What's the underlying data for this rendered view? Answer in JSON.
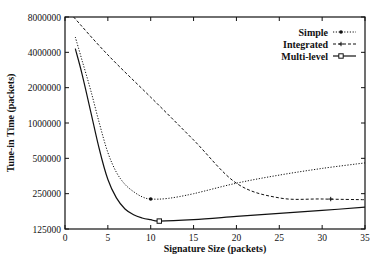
{
  "chart_data": {
    "type": "line",
    "title": "",
    "xlabel": "Signature Size (packets)",
    "ylabel": "Tune-in Time (packets)",
    "xlim": [
      0,
      35
    ],
    "ylim": [
      125000,
      8000000
    ],
    "yscale": "log2",
    "xticks": [
      0,
      5,
      10,
      15,
      20,
      25,
      30,
      35
    ],
    "yticks": [
      125000,
      250000,
      500000,
      1000000,
      2000000,
      4000000,
      8000000
    ],
    "ytick_labels": [
      "125000",
      "250000",
      "500000",
      "1000000",
      "2000000",
      "4000000",
      "8000000"
    ],
    "grid": false,
    "legend_position": "top-right",
    "series": [
      {
        "name": "Simple",
        "style": "dotted",
        "marker": "dot",
        "marker_at": [
          10,
          225000
        ],
        "x": [
          1.2,
          2,
          3,
          4,
          5,
          6,
          7,
          8,
          9,
          10,
          12,
          15,
          20,
          25,
          30,
          35
        ],
        "values": [
          5400000,
          3400000,
          1900000,
          1000000,
          560000,
          380000,
          300000,
          260000,
          235000,
          225000,
          228000,
          250000,
          307000,
          360000,
          410000,
          457000
        ]
      },
      {
        "name": "Integrated",
        "style": "dashed",
        "marker": "plus",
        "marker_at": [
          31,
          225000
        ],
        "x": [
          1,
          5,
          10,
          15,
          20,
          25,
          30,
          35
        ],
        "values": [
          8000000,
          3800000,
          1660000,
          716000,
          307000,
          230000,
          225000,
          222000
        ]
      },
      {
        "name": "Multi-level",
        "style": "solid",
        "marker": "square",
        "marker_at": [
          11,
          146000
        ],
        "x": [
          1.2,
          2,
          3,
          4,
          5,
          6,
          7,
          8,
          9,
          10,
          11,
          15,
          20,
          25,
          30,
          35
        ],
        "values": [
          4300000,
          2600000,
          1250000,
          600000,
          330000,
          230000,
          185000,
          165000,
          155000,
          150000,
          146000,
          150000,
          160000,
          170000,
          180000,
          192000
        ]
      }
    ]
  }
}
